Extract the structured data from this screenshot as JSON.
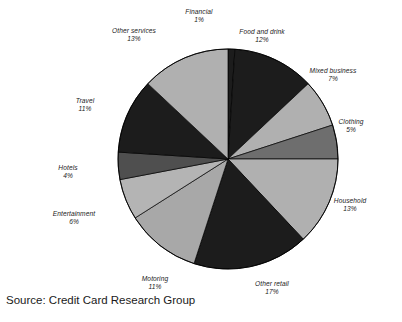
{
  "chart_data": {
    "type": "pie",
    "title": "",
    "subtitle": "",
    "xlabel": "",
    "ylabel": "",
    "legend_position": "none",
    "grid": false,
    "start_angle_deg": 0,
    "direction": "clockwise",
    "units": "percent",
    "total": 100,
    "categories": [
      "Financial",
      "Food and drink",
      "Mixed business",
      "Clothing",
      "Household",
      "Other retail",
      "Motoring",
      "Entertainment",
      "Hotels",
      "Travel",
      "Other services"
    ],
    "values": [
      1,
      12,
      7,
      5,
      13,
      17,
      11,
      6,
      4,
      11,
      13
    ],
    "slices": [
      {
        "label": "Financial",
        "value": 1,
        "value_text": "1%",
        "color": "#1c1c1c",
        "label_x": 199,
        "label_y": 8,
        "align": "center"
      },
      {
        "label": "Food and drink",
        "value": 12,
        "value_text": "12%",
        "color": "#1c1c1c",
        "label_x": 262,
        "label_y": 28,
        "align": "center"
      },
      {
        "label": "Mixed business",
        "value": 7,
        "value_text": "7%",
        "color": "#b0b0b0",
        "label_x": 333,
        "label_y": 67,
        "align": "center"
      },
      {
        "label": "Clothing",
        "value": 5,
        "value_text": "5%",
        "color": "#6e6e6e",
        "label_x": 351,
        "label_y": 118,
        "align": "center"
      },
      {
        "label": "Household",
        "value": 13,
        "value_text": "13%",
        "color": "#b0b0b0",
        "label_x": 350,
        "label_y": 197,
        "align": "center"
      },
      {
        "label": "Other retail",
        "value": 17,
        "value_text": "17%",
        "color": "#1c1c1c",
        "label_x": 272,
        "label_y": 280,
        "align": "center"
      },
      {
        "label": "Motoring",
        "value": 11,
        "value_text": "11%",
        "color": "#a8a8a8",
        "label_x": 155,
        "label_y": 275,
        "align": "center"
      },
      {
        "label": "Entertainment",
        "value": 6,
        "value_text": "6%",
        "color": "#b4b4b4",
        "label_x": 74,
        "label_y": 210,
        "align": "center"
      },
      {
        "label": "Hotels",
        "value": 4,
        "value_text": "4%",
        "color": "#4f4f4f",
        "label_x": 68,
        "label_y": 164,
        "align": "center"
      },
      {
        "label": "Travel",
        "value": 11,
        "value_text": "11%",
        "color": "#1c1c1c",
        "label_x": 85,
        "label_y": 97,
        "align": "center"
      },
      {
        "label": "Other services",
        "value": 13,
        "value_text": "13%",
        "color": "#b0b0b0",
        "label_x": 134,
        "label_y": 27,
        "align": "center"
      }
    ],
    "geometry": {
      "center_x": 228,
      "center_y": 159,
      "radius": 110
    },
    "palette": {
      "dark": "#1c1c1c",
      "mid_dark": "#6e6e6e",
      "mid": "#a8a8a8",
      "light": "#b4b4b4",
      "outline": "#000000",
      "background": "#ffffff",
      "text": "#1a1a1a"
    }
  },
  "caption": {
    "source_text": "Source: Credit Card Research Group"
  }
}
